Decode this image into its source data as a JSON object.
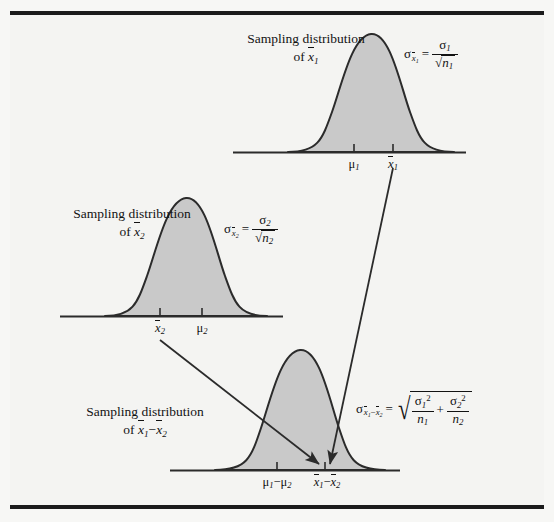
{
  "figure": {
    "title_present": false,
    "background_color": "#f4f4f2",
    "curve_fill_color": "#c9c9c9",
    "curve_stroke_color": "#2b2b2b",
    "rule_color": "#1b1b1b"
  },
  "distributions": [
    {
      "id": "dist-xbar1",
      "caption_line1": "Sampling distribution",
      "caption_line2_prefix": "of ",
      "caption_line2_symbol": "x̅1",
      "formula_text": "σ x̅1 = σ1 / √n1",
      "sigma_label": "σ",
      "sigma_sub": "x̅1",
      "numerator": "σ",
      "numerator_sub": "1",
      "denominator": "n",
      "denominator_sub": "1",
      "ticks": [
        {
          "label_main": "μ",
          "label_sub": "1",
          "name": "mu1"
        },
        {
          "label_main": "x̅",
          "label_sub": "1",
          "name": "xbar1"
        }
      ]
    },
    {
      "id": "dist-xbar2",
      "caption_line1": "Sampling distribution",
      "caption_line2_prefix": "of ",
      "caption_line2_symbol": "x̅2",
      "formula_text": "σ x̅2 = σ2 / √n2",
      "sigma_label": "σ",
      "sigma_sub": "x̅2",
      "numerator": "σ",
      "numerator_sub": "2",
      "denominator": "n",
      "denominator_sub": "2",
      "ticks": [
        {
          "label_main": "x̅",
          "label_sub": "2",
          "name": "xbar2"
        },
        {
          "label_main": "μ",
          "label_sub": "2",
          "name": "mu2"
        }
      ]
    },
    {
      "id": "dist-diff",
      "caption_line1": "Sampling distribution",
      "caption_line2_prefix": "of ",
      "caption_line2_symbol": "x̅1 − x̅2",
      "formula_text": "σ x̅1−x̅2 = √(σ1²/n1 + σ2²/n2)",
      "sigma_label": "σ",
      "sigma_sub": "x̅1 − x̅2",
      "term1_num": "σ",
      "term1_num_sub": "1",
      "term1_num_sup": "2",
      "term1_den": "n",
      "term1_den_sub": "1",
      "plus": "+",
      "term2_num": "σ",
      "term2_num_sub": "2",
      "term2_num_sup": "2",
      "term2_den": "n",
      "term2_den_sub": "2",
      "ticks": [
        {
          "label_main": "μ1 − μ2",
          "name": "mu1-minus-mu2"
        },
        {
          "label_main": "x̅1 − x̅2",
          "name": "xbar1-minus-xbar2"
        }
      ]
    }
  ],
  "symbols": {
    "sigma": "σ",
    "mu": "μ",
    "minus": "−",
    "equals": "=",
    "plus": "+",
    "radical": "√",
    "x": "x",
    "n": "n",
    "one": "1",
    "two": "2",
    "of": "of"
  },
  "arrows": [
    {
      "name": "arrow-from-xbar1",
      "from": "x̅1",
      "to": "x̅1 − x̅2"
    },
    {
      "name": "arrow-from-xbar2",
      "from": "x̅2",
      "to": "x̅1 − x̅2"
    }
  ]
}
